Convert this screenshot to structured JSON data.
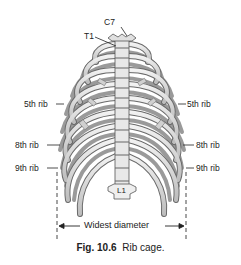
{
  "figure": {
    "number": "Fig. 10.6",
    "title": "Rib cage."
  },
  "labels": {
    "c7": "C7",
    "t1": "T1",
    "rib5_left": "5th rib",
    "rib5_right": "5th rib",
    "rib8_left": "8th rib",
    "rib8_right": "8th rib",
    "rib9_left": "9th rib",
    "rib9_right": "9th rib",
    "l1": "L1",
    "widest_diameter": "Widest diameter"
  },
  "colors": {
    "bone_fill": "#e6e6e6",
    "bone_shade": "#b5b5b5",
    "outline": "#555555",
    "text": "#222222"
  }
}
